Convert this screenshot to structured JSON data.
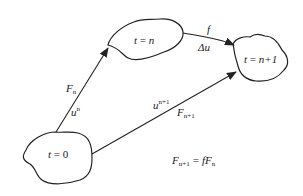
{
  "diagram": {
    "nodes": [
      {
        "id": "t0",
        "label_var": "t",
        "label_op": "=",
        "label_val": "0"
      },
      {
        "id": "tn",
        "label_var": "t",
        "label_op": "=",
        "label_val": "n"
      },
      {
        "id": "tn1",
        "label_var": "t",
        "label_op": "=",
        "label_val": "n+1"
      }
    ],
    "edges": [
      {
        "from": "t0",
        "to": "tn",
        "upper_label": {
          "base": "F",
          "sub": "n"
        },
        "lower_label": {
          "base": "u",
          "sup": "n"
        }
      },
      {
        "from": "t0",
        "to": "tn1",
        "upper_label": {
          "base": "u",
          "sup": "n+1"
        },
        "lower_label": {
          "base": "F",
          "sub": "n+1"
        }
      },
      {
        "from": "tn",
        "to": "tn1",
        "upper_label": {
          "base": "f"
        },
        "lower_label": {
          "base": "Δu"
        }
      }
    ],
    "equation": {
      "lhs_base": "F",
      "lhs_sub": "n+1",
      "op": "=",
      "rhs_base": "fF",
      "rhs_sub": "n"
    }
  }
}
